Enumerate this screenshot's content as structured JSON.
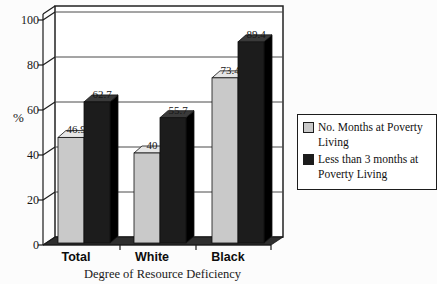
{
  "chart_data": {
    "type": "bar",
    "style": "3d-column",
    "categories": [
      "Total",
      "White",
      "Black"
    ],
    "series": [
      {
        "name": "No. Months at Poverty Living",
        "values": [
          46.9,
          40,
          73.4
        ],
        "labels": [
          "46.9",
          "40",
          "73.4"
        ],
        "colors": {
          "front": "#c9c9c9",
          "top": "#e6e6e6",
          "side": "#9a9a9a"
        }
      },
      {
        "name": "Less than 3 months at Poverty Living",
        "values": [
          62.7,
          55.7,
          89.4
        ],
        "labels": [
          "62.7",
          "55.7",
          "89.4"
        ],
        "colors": {
          "front": "#1c1c1c",
          "top": "#3a3a3a",
          "side": "#000000"
        }
      }
    ],
    "xlabel": "Degree of Resource Deficiency",
    "ylabel": "%",
    "ylim": [
      0,
      100
    ],
    "yticks": [
      0,
      20,
      40,
      60,
      80,
      100
    ],
    "grid": true,
    "legend_position": "right",
    "wall_color": "#ffffff",
    "floor_color": "#2e2e2e"
  },
  "yaxis": {
    "label": "%",
    "ticks": [
      "100",
      "80",
      "60",
      "40",
      "20",
      "0"
    ]
  }
}
